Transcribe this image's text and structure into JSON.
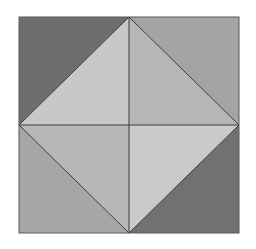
{
  "diagram": {
    "regions": [
      {
        "name": "corner-top-left",
        "color": "#6e6e6e"
      },
      {
        "name": "corner-top-right",
        "color": "#a4a4a4"
      },
      {
        "name": "corner-bottom-left",
        "color": "#a6a6a6"
      },
      {
        "name": "corner-bottom-right",
        "color": "#717171"
      },
      {
        "name": "inner-top-left",
        "color": "#c8c8c8"
      },
      {
        "name": "inner-top-right",
        "color": "#b6b6b6"
      },
      {
        "name": "inner-bottom-left",
        "color": "#b7b7b7"
      },
      {
        "name": "inner-bottom-right",
        "color": "#cacaca"
      }
    ],
    "line_color": "#3a3a3a",
    "outline_color": "#5a5a5a"
  }
}
